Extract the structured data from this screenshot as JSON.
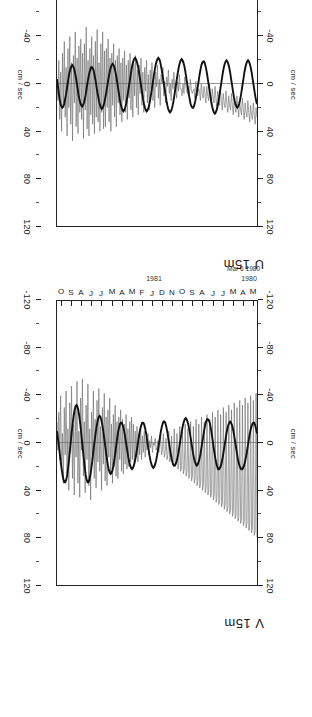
{
  "figure": {
    "orientation": "rotated-90",
    "units_label": "cm / sec",
    "start_date": "Mar 6 1980"
  },
  "panels": [
    {
      "id": "v15m",
      "title": "V 15m"
    },
    {
      "id": "u15m",
      "title": "U 15m"
    }
  ],
  "value_axis": {
    "label": "cm / sec",
    "ticks": [
      "120",
      "80",
      "40",
      "0",
      "-40",
      "-80",
      "-120"
    ],
    "min": -120,
    "max": 120,
    "minor_step": 20
  },
  "time_axis": {
    "months": [
      "O",
      "S",
      "A",
      "J",
      "J",
      "M",
      "A",
      "M",
      "F",
      "J",
      "D",
      "N",
      "O",
      "S",
      "A",
      "J",
      "J",
      "M",
      "A",
      "M"
    ],
    "year_labels": [
      "1981",
      "1980"
    ],
    "start": "Mar 6 1980"
  },
  "series": [
    {
      "name": "raw",
      "color": "#666666",
      "width": 0.55
    },
    {
      "name": "low-pass filtered",
      "color": "#111111",
      "width": 1.9
    }
  ],
  "chart_data": {
    "type": "line",
    "xlabel": "cm / sec",
    "ylabel": "",
    "xlim": [
      -120,
      120
    ],
    "grid": false,
    "legend": "none",
    "panels": [
      {
        "name": "V 15m",
        "axis_ticks": [
          120,
          80,
          40,
          0,
          -40,
          -80,
          -120
        ],
        "series": [
          {
            "name": "raw",
            "values": [
              -18,
              6,
              -26,
              14,
              -40,
              22,
              -8,
              34,
              -30,
              10,
              -44,
              26,
              -12,
              40,
              -34,
              8,
              -48,
              30,
              -16,
              44,
              -28,
              12,
              -52,
              34,
              -10,
              46,
              -38,
              6,
              -54,
              28,
              -18,
              42,
              -32,
              14,
              -50,
              36,
              -12,
              48,
              -26,
              10,
              -44,
              30,
              -20,
              38,
              -36,
              16,
              -46,
              24,
              -14,
              40,
              -30,
              18,
              -42,
              32,
              -22,
              36,
              -28,
              12,
              -38,
              26,
              -16,
              34,
              -24,
              20,
              -32,
              28,
              -18,
              30,
              -22,
              14,
              -28,
              24,
              -20,
              26,
              -16,
              18,
              -24,
              22,
              -12,
              20,
              -18,
              16,
              -22,
              14,
              -16,
              18,
              -10,
              12,
              -14,
              16,
              -8,
              10,
              -12,
              14,
              -6,
              8,
              -10,
              12,
              -4,
              6,
              -8,
              10,
              -2,
              4,
              -6,
              8,
              0,
              2,
              -4,
              6,
              4,
              -2,
              8,
              2,
              -6,
              10,
              6,
              -8,
              12,
              8,
              -4,
              14,
              10,
              -10,
              16,
              12,
              -6,
              18,
              14,
              -12,
              20,
              16,
              -8,
              22,
              18,
              -14,
              24,
              20,
              -10,
              26,
              22,
              -16,
              28,
              24,
              -12,
              30,
              26,
              -18,
              32,
              28,
              -14,
              34,
              30,
              -20,
              36,
              32,
              -16,
              38,
              34,
              -22,
              40,
              36,
              -18,
              42,
              38,
              -24,
              44,
              40,
              -20,
              46,
              42,
              -26,
              48,
              44,
              -22,
              50,
              46,
              -28,
              52,
              48,
              -24,
              54,
              50,
              -30,
              56,
              52,
              -26,
              58,
              54,
              -32,
              60,
              56,
              -28,
              62,
              58,
              -34,
              64,
              60,
              -30,
              66,
              62,
              -36,
              68,
              64,
              -32,
              70,
              66,
              -38,
              72,
              68,
              -34,
              74,
              70,
              -40,
              76,
              72,
              -36,
              78,
              74,
              -42,
              80
            ],
            "count": 220
          },
          {
            "name": "low-pass filtered",
            "values": [
              -10,
              -4,
              2,
              9,
              16,
              22,
              27,
              31,
              33,
              33,
              31,
              27,
              21,
              14,
              6,
              -2,
              -10,
              -17,
              -23,
              -28,
              -31,
              -32,
              -31,
              -28,
              -23,
              -17,
              -10,
              -2,
              6,
              14,
              21,
              27,
              31,
              33,
              33,
              31,
              27,
              22,
              16,
              9,
              2,
              -4,
              -10,
              -15,
              -19,
              -22,
              -23,
              -22,
              -19,
              -15,
              -10,
              -4,
              2,
              8,
              14,
              19,
              23,
              25,
              26,
              25,
              23,
              19,
              14,
              8,
              2,
              -4,
              -9,
              -13,
              -16,
              -17,
              -17,
              -15,
              -12,
              -8,
              -3,
              2,
              7,
              12,
              16,
              19,
              21,
              22,
              21,
              19,
              16,
              12,
              7,
              2,
              -3,
              -8,
              -12,
              -15,
              -17,
              -17,
              -16,
              -13,
              -9,
              -4,
              1,
              6,
              11,
              15,
              18,
              20,
              21,
              20,
              18,
              15,
              11,
              6,
              1,
              -4,
              -9,
              -13,
              -16,
              -18,
              -18,
              -17,
              -14,
              -10,
              -5,
              0,
              5,
              10,
              14,
              17,
              19,
              19,
              18,
              16,
              13,
              9,
              4,
              -1,
              -6,
              -11,
              -15,
              -18,
              -20,
              -21,
              -20,
              -18,
              -15,
              -11,
              -6,
              -1,
              4,
              9,
              13,
              16,
              18,
              19,
              18,
              16,
              13,
              9,
              4,
              -1,
              -6,
              -11,
              -15,
              -18,
              -20,
              -20,
              -19,
              -17,
              -13,
              -8,
              -3,
              3,
              8,
              13,
              17,
              20,
              22,
              22,
              21,
              19,
              16,
              12,
              7,
              2,
              -3,
              -8,
              -12,
              -15,
              -17,
              -18,
              -17,
              -15,
              -12,
              -8,
              -3,
              2,
              7,
              12,
              16,
              19,
              21,
              22,
              22,
              21,
              19,
              16,
              12,
              8,
              3,
              -2,
              -7,
              -11,
              -14,
              -16,
              -17,
              -17,
              -15,
              -12,
              -8
            ],
            "count": 220
          }
        ]
      },
      {
        "name": "U 15m",
        "axis_ticks": [
          120,
          80,
          40,
          0,
          -40,
          -80,
          -120
        ],
        "series": [
          {
            "name": "raw",
            "values": [
              -2,
              14,
              -20,
              30,
              -10,
              40,
              -26,
              18,
              -36,
              28,
              -14,
              44,
              -30,
              20,
              -40,
              34,
              -18,
              48,
              -24,
              16,
              -44,
              36,
              -22,
              42,
              -32,
              24,
              -38,
              30,
              -26,
              46,
              -34,
              22,
              -48,
              38,
              -20,
              44,
              -30,
              26,
              -40,
              34,
              -24,
              42,
              -36,
              28,
              -46,
              32,
              -18,
              40,
              -34,
              24,
              -44,
              38,
              -28,
              36,
              -30,
              20,
              -38,
              32,
              -22,
              40,
              -26,
              18,
              -34,
              28,
              -20,
              36,
              -24,
              16,
              -30,
              26,
              -18,
              32,
              -22,
              14,
              -28,
              24,
              -16,
              30,
              -20,
              12,
              -26,
              22,
              -14,
              28,
              -18,
              10,
              -24,
              20,
              -12,
              26,
              -16,
              8,
              -22,
              18,
              -10,
              24,
              -14,
              6,
              -20,
              16,
              -8,
              22,
              -12,
              4,
              -18,
              14,
              -6,
              20,
              -10,
              2,
              -16,
              12,
              -4,
              18,
              -8,
              0,
              -14,
              10,
              -2,
              16,
              -6,
              2,
              -12,
              8,
              0,
              14,
              -4,
              4,
              -10,
              6,
              2,
              12,
              -2,
              6,
              -8,
              4,
              4,
              10,
              0,
              8,
              -6,
              2,
              6,
              8,
              2,
              10,
              -4,
              4,
              8,
              6,
              4,
              12,
              -2,
              6,
              10,
              4,
              6,
              14,
              0,
              8,
              12,
              2,
              8,
              16,
              2,
              10,
              14,
              0,
              10,
              18,
              4,
              12,
              16,
              2,
              12,
              20,
              6,
              14,
              18,
              4,
              14,
              22,
              8,
              16,
              20,
              6,
              16,
              24,
              10,
              18,
              22,
              8,
              18,
              26,
              12,
              20,
              24,
              10,
              20,
              28,
              14,
              22,
              26,
              12,
              22,
              30,
              16,
              24,
              28,
              14,
              24,
              32,
              18,
              26,
              30,
              16,
              26,
              34,
              20,
              28
            ],
            "count": 220
          },
          {
            "name": "low-pass filtered",
            "values": [
              -4,
              2,
              8,
              13,
              17,
              19,
              20,
              19,
              17,
              13,
              9,
              4,
              -1,
              -6,
              -10,
              -13,
              -15,
              -16,
              -15,
              -13,
              -10,
              -6,
              -1,
              4,
              9,
              13,
              16,
              18,
              19,
              18,
              16,
              13,
              9,
              4,
              -1,
              -5,
              -9,
              -12,
              -14,
              -14,
              -13,
              -11,
              -7,
              -3,
              2,
              7,
              11,
              15,
              18,
              20,
              21,
              20,
              18,
              15,
              11,
              7,
              2,
              -3,
              -7,
              -11,
              -14,
              -16,
              -17,
              -16,
              -14,
              -11,
              -7,
              -2,
              3,
              8,
              13,
              17,
              20,
              22,
              23,
              22,
              20,
              17,
              13,
              8,
              3,
              -2,
              -7,
              -12,
              -16,
              -19,
              -21,
              -22,
              -21,
              -19,
              -16,
              -12,
              -7,
              -2,
              3,
              8,
              13,
              17,
              20,
              22,
              23,
              22,
              20,
              17,
              13,
              8,
              3,
              -2,
              -7,
              -12,
              -16,
              -19,
              -21,
              -22,
              -21,
              -19,
              -15,
              -11,
              -6,
              -1,
              4,
              9,
              14,
              18,
              21,
              23,
              24,
              23,
              21,
              18,
              14,
              9,
              4,
              -1,
              -6,
              -11,
              -15,
              -18,
              -20,
              -21,
              -20,
              -18,
              -15,
              -11,
              -6,
              -1,
              4,
              9,
              13,
              17,
              19,
              20,
              20,
              18,
              15,
              11,
              7,
              2,
              -3,
              -8,
              -12,
              -16,
              -18,
              -19,
              -19,
              -17,
              -14,
              -10,
              -5,
              0,
              5,
              10,
              15,
              19,
              22,
              24,
              25,
              24,
              22,
              19,
              15,
              10,
              5,
              0,
              -5,
              -10,
              -14,
              -17,
              -19,
              -20,
              -19,
              -17,
              -14,
              -10,
              -5,
              0,
              5,
              10,
              14,
              17,
              19,
              20,
              19,
              17,
              14,
              10,
              5,
              0,
              -5,
              -10,
              -14,
              -17,
              -19,
              -20,
              -19,
              -17,
              -14,
              -10,
              -5,
              0,
              5,
              10,
              14,
              17
            ],
            "count": 220
          }
        ]
      }
    ]
  }
}
